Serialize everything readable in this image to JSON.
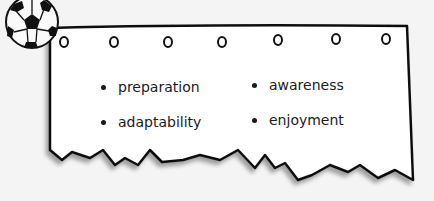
{
  "card": {
    "icon": "soccer-ball-icon",
    "rings": 7,
    "columns": [
      {
        "items": [
          "preparation",
          "adaptability"
        ]
      },
      {
        "items": [
          "awareness",
          "enjoyment"
        ]
      }
    ]
  }
}
